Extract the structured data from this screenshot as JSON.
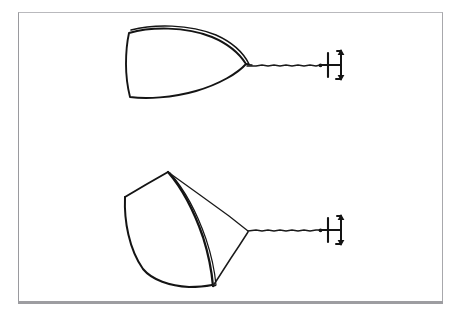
{
  "figure": {
    "background_color": "#ffffff",
    "ink_color": "#141414",
    "frame": {
      "border_color": "#9a9a9e",
      "bottom_rule_color": "#9d9da1"
    },
    "panels": [
      {
        "id": "top-panel",
        "name": "plan-view",
        "label": "",
        "shape_name": "curved-shell-plan-view",
        "description": "Teardrop / leaf shaped curved shell seen edge-on, blunt rounded left end, pointed right tip, with a thin second outline along the upper edge",
        "stem_name": "support-stem",
        "symbol_name": "rotation-arrow-symbol"
      },
      {
        "id": "bottom-panel",
        "name": "perspective-view",
        "label": "",
        "shape_name": "curved-shell-perspective-view",
        "description": "Same curved shell drawn in three-quarter perspective showing the concave inner surface, apex at top, point at bottom, straight ridge lines converging to the stem",
        "stem_name": "support-stem",
        "symbol_name": "rotation-arrow-symbol"
      }
    ],
    "symbols": {
      "support_post": "vertical-post",
      "arm": "horizontal-arm",
      "rotation_arrow": "double-headed-vertical-arrow"
    }
  }
}
